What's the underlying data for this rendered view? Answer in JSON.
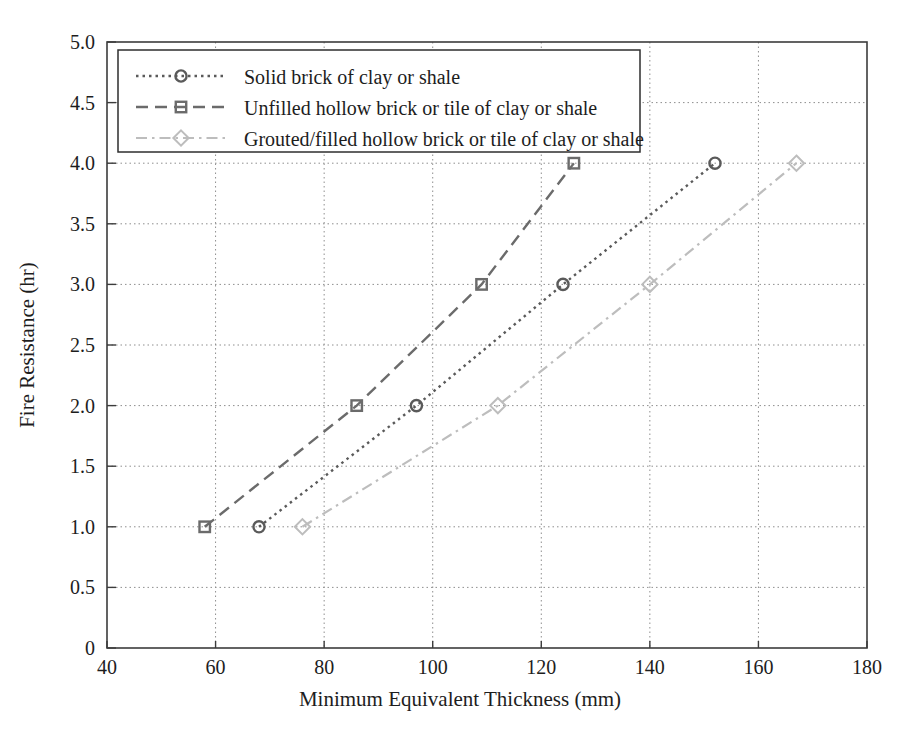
{
  "chart_data": {
    "type": "line",
    "title": "",
    "xlabel": "Minimum Equivalent Thickness (mm)",
    "ylabel": "Fire Resistance (hr)",
    "xlim": [
      40,
      180
    ],
    "ylim": [
      0,
      5
    ],
    "xticks": [
      40,
      60,
      80,
      100,
      120,
      140,
      160,
      180
    ],
    "xtick_labels": [
      "40",
      "60",
      "80",
      "100",
      "120",
      "140",
      "160",
      "180"
    ],
    "yticks": [
      0,
      0.5,
      1.0,
      1.5,
      2.0,
      2.5,
      3.0,
      3.5,
      4.0,
      4.5,
      5.0
    ],
    "ytick_labels": [
      "0",
      "0.5",
      "1.0",
      "1.5",
      "2.0",
      "2.5",
      "3.0",
      "3.5",
      "4.0",
      "4.5",
      "5.0"
    ],
    "grid": true,
    "grid_style": "dotted",
    "legend_position": "upper left",
    "series": [
      {
        "name": "Solid brick of clay or shale",
        "marker": "circle",
        "linestyle": "dotted",
        "color": "#5a5a5a",
        "x": [
          68,
          97,
          124,
          152
        ],
        "y": [
          1.0,
          2.0,
          3.0,
          4.0
        ]
      },
      {
        "name": "Unfilled hollow brick or tile of clay or shale",
        "marker": "square",
        "linestyle": "dashed",
        "color": "#6b6b6b",
        "x": [
          58,
          86,
          109,
          126
        ],
        "y": [
          1.0,
          2.0,
          3.0,
          4.0
        ]
      },
      {
        "name": "Grouted/filled hollow brick or tile of clay or shale",
        "marker": "diamond",
        "linestyle": "dashdot",
        "color": "#bdbdbd",
        "x": [
          76,
          112,
          140,
          167
        ],
        "y": [
          1.0,
          2.0,
          3.0,
          4.0
        ]
      }
    ]
  },
  "legend": {
    "items": [
      "Solid brick of clay or shale",
      "Unfilled hollow brick or tile of clay or shale",
      "Grouted/filled hollow brick or tile of clay or shale"
    ]
  },
  "axes": {
    "x_title": "Minimum Equivalent Thickness (mm)",
    "y_title": "Fire Resistance (hr)"
  },
  "colors": {
    "axis": "#3c3c3c",
    "grid": "#8e8e8e",
    "series_1": "#5a5a5a",
    "series_2": "#6b6b6b",
    "series_3": "#bdbdbd",
    "text": "#1d1d1d",
    "background": "#ffffff"
  }
}
